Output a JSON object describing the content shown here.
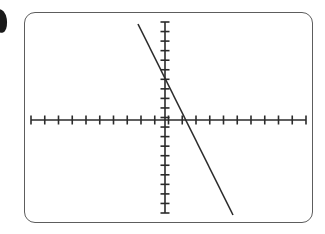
{
  "page": {
    "background_color": "#ffffff"
  },
  "edge_mark": {
    "name": "partial-glyph",
    "description": "dark ink mark clipped at left page edge",
    "color": "#1a1a1a"
  },
  "calculator_screen": {
    "frame_color": "#5d5d5d",
    "frame_corner_radius": 11,
    "screen_background": "#ffffff",
    "label": "graph viewport"
  },
  "chart_data": {
    "type": "line",
    "title": "",
    "subtitle": "",
    "xlabel": "",
    "ylabel": "",
    "grid": false,
    "legend": null,
    "annotations": [],
    "axis_style": {
      "color": "#2b2b2b",
      "line_width": 1.6,
      "tick_length": 9,
      "tick_width": 1.6,
      "arrowheads": false,
      "end_caps": true
    },
    "xaxis": {
      "pixel_y": 120,
      "pixel_x_start": 31,
      "pixel_x_end": 306,
      "range": [
        -10,
        10
      ],
      "tick_step": 1,
      "tick_count": 21,
      "tick_labels": [],
      "ticks": [
        -10,
        -9,
        -8,
        -7,
        -6,
        -5,
        -4,
        -3,
        -2,
        -1,
        0,
        1,
        2,
        3,
        4,
        5,
        6,
        7,
        8,
        9,
        10
      ]
    },
    "yaxis": {
      "pixel_x": 165,
      "pixel_y_top": 22,
      "pixel_y_bottom": 213,
      "range": [
        -10,
        10
      ],
      "tick_step": 1,
      "tick_count": 21,
      "tick_labels": [],
      "ticks": [
        -10,
        -9,
        -8,
        -7,
        -6,
        -5,
        -4,
        -3,
        -2,
        -1,
        0,
        1,
        2,
        3,
        4,
        5,
        6,
        7,
        8,
        9,
        10
      ]
    },
    "series": [
      {
        "name": "line",
        "color": "#2b2b2b",
        "line_width": 1.6,
        "slope": -2,
        "y_intercept": 4.4,
        "x_intercept": 2.2,
        "x": [
          -2.8,
          7.2
        ],
        "y": [
          10.0,
          -10.0
        ],
        "pixel_points": [
          [
            138,
            24
          ],
          [
            233,
            215
          ]
        ]
      }
    ]
  }
}
